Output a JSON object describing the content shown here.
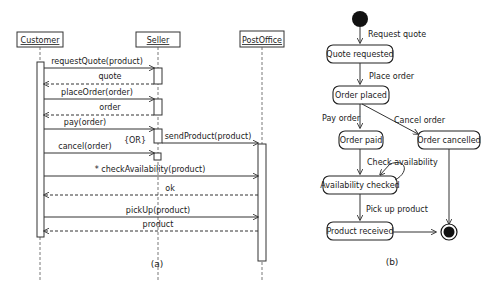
{
  "sequence_diagram": {
    "caption": "(a)",
    "lifelines": [
      {
        "name": "Customer"
      },
      {
        "name": "Seller"
      },
      {
        "name": "PostOffice"
      }
    ],
    "messages": [
      {
        "from": "Customer",
        "to": "Seller",
        "label": "requestQuote(product)",
        "type": "call"
      },
      {
        "from": "Seller",
        "to": "Customer",
        "label": "quote",
        "type": "return"
      },
      {
        "from": "Customer",
        "to": "Seller",
        "label": "placeOrder(order)",
        "type": "call"
      },
      {
        "from": "Seller",
        "to": "Customer",
        "label": "order",
        "type": "return"
      },
      {
        "from": "Customer",
        "to": "Seller",
        "label": "pay(order)",
        "type": "call"
      },
      {
        "from": "Seller",
        "to": "PostOffice",
        "label": "sendProduct(product)",
        "type": "call"
      },
      {
        "from": "Customer",
        "to": "Seller",
        "label": "cancel(order)",
        "type": "call"
      },
      {
        "from": "Customer",
        "to": "PostOffice",
        "label": "* checkAvailability(product)",
        "type": "call"
      },
      {
        "from": "PostOffice",
        "to": "Customer",
        "label": "ok",
        "type": "return"
      },
      {
        "from": "Customer",
        "to": "PostOffice",
        "label": "pickUp(product)",
        "type": "call"
      },
      {
        "from": "PostOffice",
        "to": "Customer",
        "label": "product",
        "type": "return"
      }
    ],
    "or_label": "{OR}"
  },
  "state_diagram": {
    "caption": "(b)",
    "states": [
      {
        "id": "quote_requested",
        "label": "Quote requested"
      },
      {
        "id": "order_placed",
        "label": "Order placed"
      },
      {
        "id": "order_paid",
        "label": "Order paid"
      },
      {
        "id": "order_cancelled",
        "label": "Order cancelled"
      },
      {
        "id": "availability_checked",
        "label": "Availability checked"
      },
      {
        "id": "product_received",
        "label": "Product received"
      }
    ],
    "transitions": [
      {
        "from": "initial",
        "to": "quote_requested",
        "label": "Request quote"
      },
      {
        "from": "quote_requested",
        "to": "order_placed",
        "label": "Place order"
      },
      {
        "from": "order_placed",
        "to": "order_paid",
        "label": "Pay order"
      },
      {
        "from": "order_placed",
        "to": "order_cancelled",
        "label": "Cancel order"
      },
      {
        "from": "order_paid",
        "to": "availability_checked",
        "label": "Check availability"
      },
      {
        "from": "availability_checked",
        "to": "availability_checked",
        "label": ""
      },
      {
        "from": "availability_checked",
        "to": "product_received",
        "label": "Pick up product"
      },
      {
        "from": "product_received",
        "to": "final",
        "label": ""
      },
      {
        "from": "order_cancelled",
        "to": "final",
        "label": ""
      }
    ]
  }
}
